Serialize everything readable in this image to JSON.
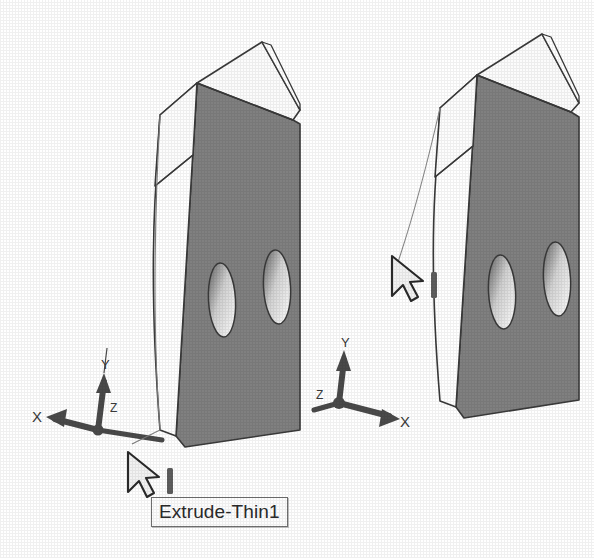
{
  "scene": {
    "background_color": "#ffffff",
    "line_color": "#3a3a3a",
    "face_front_color": "#ffffff",
    "face_side_color": "#808080",
    "face_top_color": "#fbfbfb",
    "hole_color": "#ffffff",
    "triad_color": "#4a4a4a",
    "cursor_color": "#f2f2f2",
    "cursor_outline_color": "#2a2a2a"
  },
  "views": [
    {
      "id": "view-left",
      "name": "left-view",
      "tooltip": {
        "label": "Extrude-Thin1",
        "name": "tooltip-extrude-thin1-left"
      },
      "cursor": {
        "name": "mouse-pointer-left",
        "x": 128,
        "y": 452
      },
      "triad": {
        "name": "coordinate-triad-left",
        "origin_x": 98,
        "origin_y": 430,
        "axes": [
          {
            "label": "X",
            "name": "triad-axis-x",
            "direction": "left"
          },
          {
            "label": "Y",
            "name": "triad-axis-y",
            "direction": "up"
          },
          {
            "label": "Z",
            "name": "triad-axis-z",
            "direction": "right-down"
          }
        ]
      },
      "part": {
        "name": "extruded-thin-plate",
        "holes": 2,
        "feature": "Extrude-Thin1"
      }
    },
    {
      "id": "view-right",
      "name": "right-view",
      "tooltip": {
        "label": "Extrude-Thin1",
        "name": "tooltip-extrude-thin1-right"
      },
      "cursor": {
        "name": "mouse-pointer-right",
        "x": 392,
        "y": 256
      },
      "triad": {
        "name": "coordinate-triad-right",
        "origin_x": 339,
        "origin_y": 403,
        "axes": [
          {
            "label": "X",
            "name": "triad-axis-x",
            "direction": "right"
          },
          {
            "label": "Y",
            "name": "triad-axis-y",
            "direction": "up"
          },
          {
            "label": "Z",
            "name": "triad-axis-z",
            "direction": "left-down"
          }
        ]
      },
      "part": {
        "name": "extruded-thin-plate",
        "holes": 2,
        "feature": "Extrude-Thin1"
      }
    }
  ]
}
